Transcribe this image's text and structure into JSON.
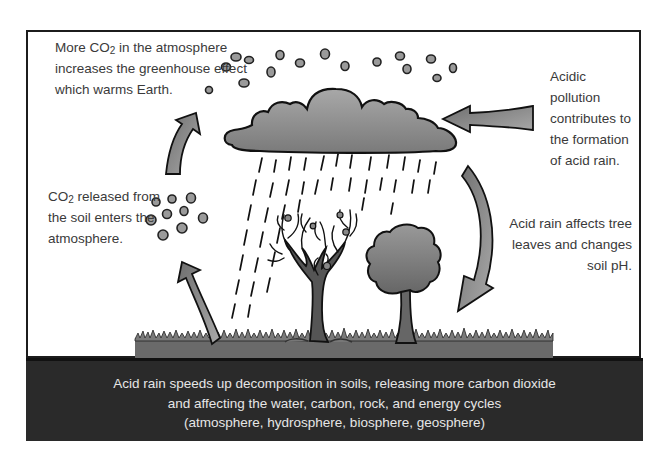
{
  "diagram": {
    "captions": {
      "top_left": {
        "pre": "More CO",
        "sub": "2",
        "post": " in the atmosphere increases the greenhouse effect which warms Earth."
      },
      "mid_left": {
        "pre": "CO",
        "sub": "2",
        "post": " released from the soil enters the atmosphere."
      },
      "top_right": "Acidic pollution contributes to the formation of acid rain.",
      "mid_right": "Acid rain affects tree leaves and changes soil pH."
    },
    "bottom_panel": {
      "line1": "Acid rain speeds up decomposition in soils, releasing more carbon dioxide",
      "line2": "and affecting the water, carbon, rock, and energy cycles",
      "line3": "(atmosphere, hydrosphere, biosphere, geosphere)"
    },
    "elements": [
      {
        "name": "cloud",
        "icon": "cloud-icon"
      },
      {
        "name": "rain",
        "icon": "rain-icon"
      },
      {
        "name": "bare-tree",
        "icon": "bare-tree-icon"
      },
      {
        "name": "leafy-tree",
        "icon": "tree-icon"
      },
      {
        "name": "co2-molecules",
        "icon": "molecule-dots-icon"
      },
      {
        "name": "grass",
        "icon": "grass-icon"
      }
    ],
    "colors": {
      "frame": "#1c1c1c",
      "panel": "#2a2a2a",
      "panel_text": "#e6e6e6",
      "caption_text": "#3a3a3a",
      "fill_gray": "#8a8a8a",
      "ground": "#6a6a6a"
    }
  }
}
